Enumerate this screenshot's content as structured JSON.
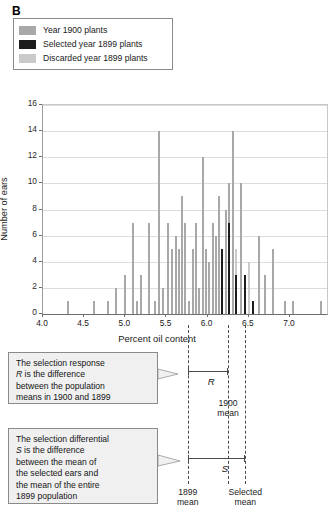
{
  "panel": {
    "letter": "B"
  },
  "legend": {
    "items": [
      {
        "label": "Year 1900 plants",
        "color": "#a8a8a8",
        "key": "year-1900"
      },
      {
        "label": "Selected year 1899 plants",
        "color": "#1c1c1c",
        "key": "selected-1899"
      },
      {
        "label": "Discarded year 1899 plants",
        "color": "#cacaca",
        "key": "discarded-1899"
      }
    ]
  },
  "chart_data": {
    "type": "bar",
    "title": "",
    "xlabel": "Percent oil content",
    "ylabel": "Number of ears",
    "xlim": [
      4.0,
      7.45
    ],
    "ylim": [
      0,
      16
    ],
    "xticks": [
      "4.0",
      "4.5",
      "5.0",
      "5.5",
      "6.0",
      "6.5",
      "7.0"
    ],
    "xtick_values": [
      4.0,
      4.5,
      5.0,
      5.5,
      6.0,
      6.5,
      7.0
    ],
    "yticks": [
      "0",
      "2",
      "4",
      "6",
      "8",
      "10",
      "12",
      "14",
      "16"
    ],
    "ytick_values": [
      0,
      2,
      4,
      6,
      8,
      10,
      12,
      14,
      16
    ],
    "grid": "horizontal",
    "legend_position": "above-plot",
    "series": [
      {
        "name": "Year 1900 plants",
        "color": "#a8a8a8"
      },
      {
        "name": "Selected year 1899 plants",
        "color": "#1c1c1c"
      },
      {
        "name": "Discarded year 1899 plants",
        "color": "#cacaca"
      }
    ],
    "bars": [
      {
        "x": 4.3,
        "y": 1,
        "series": 0
      },
      {
        "x": 4.62,
        "y": 1,
        "series": 0
      },
      {
        "x": 4.79,
        "y": 1,
        "series": 0
      },
      {
        "x": 4.89,
        "y": 2,
        "series": 0
      },
      {
        "x": 5.0,
        "y": 3,
        "series": 0
      },
      {
        "x": 5.09,
        "y": 7,
        "series": 0
      },
      {
        "x": 5.14,
        "y": 1,
        "series": 0
      },
      {
        "x": 5.19,
        "y": 3,
        "series": 0
      },
      {
        "x": 5.29,
        "y": 7,
        "series": 0
      },
      {
        "x": 5.36,
        "y": 1,
        "series": 0
      },
      {
        "x": 5.41,
        "y": 14,
        "series": 0
      },
      {
        "x": 5.46,
        "y": 2,
        "series": 0
      },
      {
        "x": 5.52,
        "y": 7,
        "series": 0
      },
      {
        "x": 5.57,
        "y": 5,
        "series": 0
      },
      {
        "x": 5.61,
        "y": 6,
        "series": 0
      },
      {
        "x": 5.65,
        "y": 5,
        "series": 0
      },
      {
        "x": 5.69,
        "y": 9,
        "series": 0
      },
      {
        "x": 5.73,
        "y": 7,
        "series": 0
      },
      {
        "x": 5.77,
        "y": 1,
        "series": 0
      },
      {
        "x": 5.82,
        "y": 5,
        "series": 0
      },
      {
        "x": 5.86,
        "y": 7,
        "series": 0
      },
      {
        "x": 5.9,
        "y": 2,
        "series": 0
      },
      {
        "x": 5.94,
        "y": 12,
        "series": 0
      },
      {
        "x": 5.98,
        "y": 5,
        "series": 0
      },
      {
        "x": 6.02,
        "y": 4,
        "series": 0
      },
      {
        "x": 6.06,
        "y": 7,
        "series": 0
      },
      {
        "x": 6.1,
        "y": 6,
        "series": 0
      },
      {
        "x": 6.14,
        "y": 9,
        "series": 0
      },
      {
        "x": 6.18,
        "y": 3,
        "series": 2
      },
      {
        "x": 6.18,
        "y": 5,
        "series": 1
      },
      {
        "x": 6.22,
        "y": 8,
        "series": 0
      },
      {
        "x": 6.26,
        "y": 10,
        "series": 0
      },
      {
        "x": 6.26,
        "y": 7,
        "series": 1
      },
      {
        "x": 6.31,
        "y": 14,
        "series": 0
      },
      {
        "x": 6.35,
        "y": 5,
        "series": 2
      },
      {
        "x": 6.35,
        "y": 3,
        "series": 1
      },
      {
        "x": 6.41,
        "y": 10,
        "series": 0
      },
      {
        "x": 6.45,
        "y": 3,
        "series": 1
      },
      {
        "x": 6.5,
        "y": 4,
        "series": 2
      },
      {
        "x": 6.55,
        "y": 1,
        "series": 1
      },
      {
        "x": 6.62,
        "y": 6,
        "series": 0
      },
      {
        "x": 6.7,
        "y": 3,
        "series": 0
      },
      {
        "x": 6.79,
        "y": 5,
        "series": 0
      },
      {
        "x": 6.94,
        "y": 1,
        "series": 0
      },
      {
        "x": 7.04,
        "y": 1,
        "series": 0
      },
      {
        "x": 7.38,
        "y": 1,
        "series": 0
      }
    ],
    "reference_lines": [
      {
        "key": "mean-1899",
        "x": 5.77,
        "label": "1899\nmean",
        "label_line1": "1899",
        "label_line2": "mean",
        "style": "dashed"
      },
      {
        "key": "mean-1900",
        "x": 6.26,
        "label": "1900\nmean",
        "label_line1": "1900",
        "label_line2": "mean",
        "style": "dashed"
      },
      {
        "key": "mean-selected",
        "x": 6.47,
        "label": "Selected\nmean",
        "label_line1": "Selected",
        "label_line2": "mean",
        "style": "dashed"
      }
    ],
    "annotations": [
      {
        "key": "bracket-R",
        "symbol": "R",
        "from_x": 5.77,
        "to_x": 6.26
      },
      {
        "key": "bracket-S",
        "symbol": "S",
        "from_x": 5.77,
        "to_x": 6.47
      }
    ]
  },
  "callouts": [
    {
      "key": "selection-response",
      "lines": [
        "The selection response",
        "R is the difference",
        "between the population",
        "means in 1900 and 1899"
      ]
    },
    {
      "key": "selection-differential",
      "lines": [
        "The selection differential",
        "S is the difference",
        "between the mean of",
        "the selected ears and",
        "the mean of the entire",
        "1899 population"
      ]
    }
  ]
}
